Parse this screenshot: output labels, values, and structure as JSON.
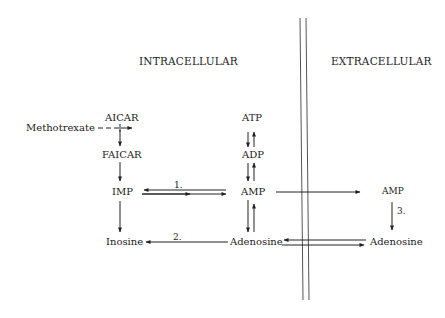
{
  "headers": {
    "intracellular": "INTRACELLULAR",
    "extracellular": "EXTRACELLULAR"
  },
  "nodes": {
    "methotrexate": "Methotrexate",
    "aicar": "AICAR",
    "faicar": "FAICAR",
    "imp": "IMP",
    "inosine": "Inosine",
    "atp": "ATP",
    "adp": "ADP",
    "amp_in": "AMP",
    "adenosine_in": "Adenosine",
    "amp_out": "AMP",
    "adenosine_out": "Adenosine"
  },
  "steps": {
    "s1": "1.",
    "s2": "2.",
    "s3": "3."
  },
  "edges": [
    {
      "from": "Methotrexate",
      "to": "AICAR-pathway",
      "style": "dashed-inhibition"
    },
    {
      "from": "AICAR",
      "to": "FAICAR"
    },
    {
      "from": "FAICAR",
      "to": "IMP"
    },
    {
      "from": "IMP",
      "to": "Inosine"
    },
    {
      "from": "IMP",
      "to": "AMP",
      "bidirectional": true,
      "label": "1."
    },
    {
      "from": "ATP",
      "to": "ADP",
      "bidirectional": true
    },
    {
      "from": "ADP",
      "to": "AMP",
      "bidirectional": true
    },
    {
      "from": "AMP",
      "to": "Adenosine",
      "bidirectional": true
    },
    {
      "from": "Adenosine",
      "to": "Inosine",
      "label": "2."
    },
    {
      "from": "AMP (intracellular)",
      "to": "AMP (extracellular)"
    },
    {
      "from": "AMP (extracellular)",
      "to": "Adenosine (extracellular)",
      "label": "3."
    },
    {
      "from": "Adenosine (intracellular)",
      "to": "Adenosine (extracellular)",
      "bidirectional": true
    }
  ]
}
